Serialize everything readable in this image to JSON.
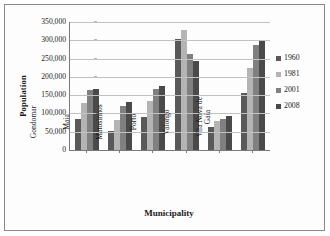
{
  "chart_data": {
    "type": "bar",
    "title": "",
    "xlabel": "Municipality",
    "ylabel": "Population",
    "categories": [
      "Gondomar",
      "Maia",
      "Matosinhos",
      "Porto",
      "Valongo",
      "Vila Nova de\nGaia"
    ],
    "series": [
      {
        "name": "1960",
        "color": "#595959",
        "values": [
          85000,
          52000,
          90000,
          303000,
          62000,
          156000
        ]
      },
      {
        "name": "1981",
        "color": "#b4b4b4",
        "values": [
          129000,
          81000,
          135000,
          327000,
          79000,
          225000
        ]
      },
      {
        "name": "2001",
        "color": "#808080",
        "values": [
          163000,
          119000,
          167000,
          263000,
          85000,
          287000
        ]
      },
      {
        "name": "2008",
        "color": "#4a4a4a",
        "values": [
          167000,
          131000,
          174000,
          243000,
          92000,
          300000
        ]
      }
    ],
    "ylim": [
      0,
      350000
    ],
    "yticks": [
      "0",
      "50,000",
      "100,000",
      "150,000",
      "200,000",
      "250,000",
      "300,000",
      "350,000"
    ],
    "ytick_values": [
      0,
      50000,
      100000,
      150000,
      200000,
      250000,
      300000,
      350000
    ],
    "grid": true,
    "legend_position": "right"
  }
}
